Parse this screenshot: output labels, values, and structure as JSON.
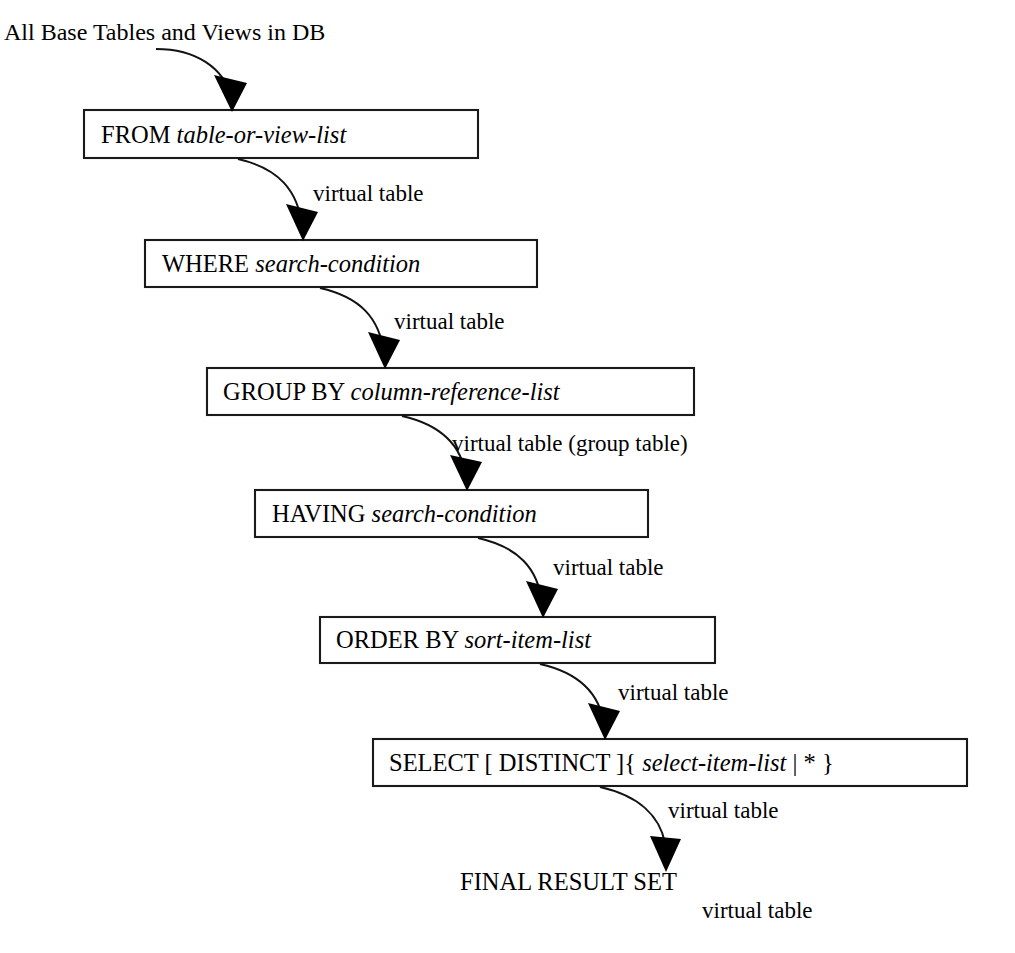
{
  "diagram": {
    "source_label": "All Base Tables and Views in DB",
    "final_label": "FINAL RESULT SET",
    "stages": [
      {
        "id": "from",
        "keyword": "FROM ",
        "operand": "table-or-view-list",
        "box": {
          "x": 84,
          "y": 110,
          "w": 394,
          "h": 48
        },
        "text_x": 101,
        "text_baseline": 143
      },
      {
        "id": "where",
        "keyword": "WHERE ",
        "operand": "search-condition",
        "box": {
          "x": 145,
          "y": 240,
          "w": 392,
          "h": 47
        },
        "text_x": 162,
        "text_baseline": 272
      },
      {
        "id": "group-by",
        "keyword": "GROUP BY ",
        "operand": "column-reference-list",
        "box": {
          "x": 207,
          "y": 368,
          "w": 487,
          "h": 47
        },
        "text_x": 223,
        "text_baseline": 400
      },
      {
        "id": "having",
        "keyword": "HAVING ",
        "operand": "search-condition",
        "box": {
          "x": 255,
          "y": 490,
          "w": 393,
          "h": 47
        },
        "text_x": 272,
        "text_baseline": 522
      },
      {
        "id": "order-by",
        "keyword": "ORDER BY ",
        "operand": "sort-item-list",
        "box": {
          "x": 320,
          "y": 617,
          "w": 395,
          "h": 46
        },
        "text_x": 336,
        "text_baseline": 648
      },
      {
        "id": "select",
        "keyword": "SELECT [ DISTINCT ]{ ",
        "operand": "select-item-list",
        "suffix": " | * }",
        "box": {
          "x": 373,
          "y": 739,
          "w": 594,
          "h": 47
        },
        "text_x": 389,
        "text_baseline": 771
      }
    ],
    "edges": [
      {
        "id": "source-to-from",
        "label": "",
        "path": "M 156,49 C 196,49 224,68 231,97",
        "head": {
          "tip_x": 232,
          "tip_y": 112,
          "left_x": 214,
          "left_y": 75,
          "right_x": 247,
          "right_y": 83
        }
      },
      {
        "id": "from-to-where",
        "label": "virtual table",
        "label_x": 313,
        "label_baseline": 201,
        "path": "M 238,159 C 278,168 298,190 302,226",
        "head": {
          "tip_x": 303,
          "tip_y": 241,
          "left_x": 286,
          "left_y": 204,
          "right_x": 318,
          "right_y": 212
        }
      },
      {
        "id": "where-to-group",
        "label": "virtual table",
        "label_x": 394,
        "label_baseline": 329,
        "path": "M 320,288 C 360,297 380,318 384,354",
        "head": {
          "tip_x": 385,
          "tip_y": 369,
          "left_x": 368,
          "left_y": 332,
          "right_x": 400,
          "right_y": 340
        }
      },
      {
        "id": "group-to-having",
        "label": "virtual table (group table)",
        "label_x": 452,
        "label_baseline": 451,
        "path": "M 402,416 C 442,425 462,446 466,477",
        "head": {
          "tip_x": 467,
          "tip_y": 491,
          "left_x": 450,
          "left_y": 455,
          "right_x": 482,
          "right_y": 462
        }
      },
      {
        "id": "having-to-order",
        "label": "virtual table",
        "label_x": 553,
        "label_baseline": 575,
        "path": "M 478,538 C 518,547 538,568 542,603",
        "head": {
          "tip_x": 543,
          "tip_y": 618,
          "left_x": 526,
          "left_y": 581,
          "right_x": 558,
          "right_y": 589
        }
      },
      {
        "id": "order-to-select",
        "label": "virtual table",
        "label_x": 618,
        "label_baseline": 700,
        "path": "M 540,664 C 580,673 600,694 604,725",
        "head": {
          "tip_x": 605,
          "tip_y": 740,
          "left_x": 588,
          "left_y": 703,
          "right_x": 620,
          "right_y": 711
        }
      },
      {
        "id": "select-to-final",
        "label": "virtual table",
        "label_x": 668,
        "label_baseline": 818,
        "path": "M 600,787 C 640,796 660,817 665,843",
        "head": {
          "tip_x": 666,
          "tip_y": 872,
          "left_x": 650,
          "left_y": 836,
          "right_x": 681,
          "right_y": 839
        }
      }
    ],
    "final_label_x": 460,
    "final_label_baseline": 890,
    "final_virtual_label": "virtual table",
    "final_virtual_label_x": 702,
    "final_virtual_label_baseline": 918,
    "source_label_x": 4,
    "source_label_baseline": 40,
    "colors": {
      "background": "#ffffff",
      "stroke": "#1a1a1a",
      "text": "#000000"
    }
  }
}
